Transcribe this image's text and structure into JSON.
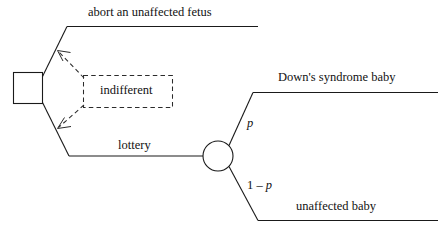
{
  "diagram": {
    "type": "decision-tree",
    "title": "",
    "nodes": [
      {
        "id": "decision-node",
        "shape": "square",
        "role": "decision",
        "label": ""
      },
      {
        "id": "chance-node",
        "shape": "circle",
        "role": "chance",
        "label": ""
      }
    ],
    "branches": {
      "abort_label": "abort an unaffected fetus",
      "lottery_label": "lottery",
      "downs_label": "Down's syndrome baby",
      "unaffected_label": "unaffected baby"
    },
    "probabilities": {
      "upper": "p",
      "lower_prefix": "1 – ",
      "lower_symbol": "p"
    },
    "annotation": {
      "indifferent_label": "indifferent"
    },
    "colors": {
      "line": "#1a1a1a",
      "dashed": "#2b2b2b",
      "text": "#111111",
      "background": "#ffffff"
    }
  }
}
